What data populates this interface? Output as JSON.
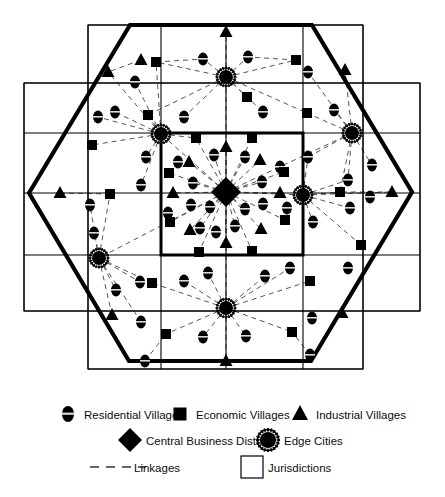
{
  "figure": {
    "colors": {
      "ink": "#000000",
      "background": "#ffffff",
      "linkage": "#555555",
      "jurisdiction_line": "#000000",
      "hexagon": "#000000"
    },
    "hexagon": {
      "name": "metropolitan-boundary",
      "vertices": [
        [
          29,
          193
        ],
        [
          130,
          25
        ],
        [
          312,
          25
        ],
        [
          412,
          192
        ],
        [
          311,
          361
        ],
        [
          129,
          361
        ]
      ]
    },
    "jurisdiction_grid": {
      "vertical_lines": [
        24,
        88,
        161,
        226,
        303,
        363,
        420
      ],
      "horizontal_lines": [
        25,
        83,
        133,
        193,
        255,
        311,
        369
      ],
      "outer_rect": {
        "x": 24,
        "y": 83,
        "w": 396,
        "h": 228
      },
      "inner_rect": {
        "x": 88,
        "y": 25,
        "w": 275,
        "h": 344
      },
      "central_jurisdiction": {
        "x": 161,
        "y": 133,
        "w": 142,
        "h": 122
      }
    },
    "central_business_district": {
      "x": 226,
      "y": 192,
      "r": 15
    },
    "edge_cities": [
      {
        "x": 226,
        "y": 77
      },
      {
        "x": 161,
        "y": 134
      },
      {
        "x": 352,
        "y": 133
      },
      {
        "x": 303,
        "y": 195
      },
      {
        "x": 99,
        "y": 258
      },
      {
        "x": 226,
        "y": 308
      }
    ],
    "residential_villages": [
      {
        "x": 203,
        "y": 59
      },
      {
        "x": 248,
        "y": 57
      },
      {
        "x": 135,
        "y": 82
      },
      {
        "x": 308,
        "y": 72
      },
      {
        "x": 115,
        "y": 112
      },
      {
        "x": 184,
        "y": 117
      },
      {
        "x": 263,
        "y": 112
      },
      {
        "x": 334,
        "y": 110
      },
      {
        "x": 98,
        "y": 117
      },
      {
        "x": 146,
        "y": 157
      },
      {
        "x": 141,
        "y": 185
      },
      {
        "x": 90,
        "y": 205
      },
      {
        "x": 178,
        "y": 162
      },
      {
        "x": 214,
        "y": 155
      },
      {
        "x": 245,
        "y": 157
      },
      {
        "x": 193,
        "y": 183
      },
      {
        "x": 262,
        "y": 182
      },
      {
        "x": 210,
        "y": 207
      },
      {
        "x": 245,
        "y": 209
      },
      {
        "x": 263,
        "y": 204
      },
      {
        "x": 191,
        "y": 205
      },
      {
        "x": 168,
        "y": 213
      },
      {
        "x": 200,
        "y": 228
      },
      {
        "x": 235,
        "y": 226
      },
      {
        "x": 216,
        "y": 232
      },
      {
        "x": 280,
        "y": 167
      },
      {
        "x": 287,
        "y": 208
      },
      {
        "x": 308,
        "y": 157
      },
      {
        "x": 313,
        "y": 222
      },
      {
        "x": 348,
        "y": 180
      },
      {
        "x": 350,
        "y": 208
      },
      {
        "x": 372,
        "y": 165
      },
      {
        "x": 370,
        "y": 197
      },
      {
        "x": 140,
        "y": 282
      },
      {
        "x": 116,
        "y": 290
      },
      {
        "x": 184,
        "y": 281
      },
      {
        "x": 208,
        "y": 273
      },
      {
        "x": 265,
        "y": 276
      },
      {
        "x": 290,
        "y": 268
      },
      {
        "x": 348,
        "y": 268
      },
      {
        "x": 203,
        "y": 337
      },
      {
        "x": 246,
        "y": 336
      },
      {
        "x": 145,
        "y": 361
      },
      {
        "x": 310,
        "y": 355
      },
      {
        "x": 94,
        "y": 233
      },
      {
        "x": 141,
        "y": 322
      },
      {
        "x": 312,
        "y": 318
      }
    ],
    "economic_villages": [
      {
        "x": 156,
        "y": 62
      },
      {
        "x": 296,
        "y": 60
      },
      {
        "x": 148,
        "y": 115
      },
      {
        "x": 307,
        "y": 113
      },
      {
        "x": 92,
        "y": 145
      },
      {
        "x": 196,
        "y": 138
      },
      {
        "x": 252,
        "y": 138
      },
      {
        "x": 169,
        "y": 173
      },
      {
        "x": 284,
        "y": 172
      },
      {
        "x": 170,
        "y": 222
      },
      {
        "x": 285,
        "y": 220
      },
      {
        "x": 199,
        "y": 252
      },
      {
        "x": 252,
        "y": 251
      },
      {
        "x": 110,
        "y": 194
      },
      {
        "x": 340,
        "y": 192
      },
      {
        "x": 152,
        "y": 283
      },
      {
        "x": 310,
        "y": 281
      },
      {
        "x": 166,
        "y": 334
      },
      {
        "x": 292,
        "y": 332
      },
      {
        "x": 361,
        "y": 245
      },
      {
        "x": 247,
        "y": 97
      }
    ],
    "industrial_villages": [
      {
        "x": 226,
        "y": 32
      },
      {
        "x": 108,
        "y": 72
      },
      {
        "x": 345,
        "y": 70
      },
      {
        "x": 226,
        "y": 147
      },
      {
        "x": 189,
        "y": 162
      },
      {
        "x": 260,
        "y": 160
      },
      {
        "x": 173,
        "y": 193
      },
      {
        "x": 280,
        "y": 193
      },
      {
        "x": 190,
        "y": 230
      },
      {
        "x": 261,
        "y": 229
      },
      {
        "x": 226,
        "y": 243
      },
      {
        "x": 60,
        "y": 193
      },
      {
        "x": 392,
        "y": 192
      },
      {
        "x": 112,
        "y": 315
      },
      {
        "x": 342,
        "y": 313
      },
      {
        "x": 226,
        "y": 361
      },
      {
        "x": 141,
        "y": 60
      }
    ],
    "linkages": [
      [
        226,
        192,
        226,
        77
      ],
      [
        226,
        192,
        161,
        134
      ],
      [
        226,
        192,
        352,
        133
      ],
      [
        226,
        192,
        303,
        195
      ],
      [
        226,
        192,
        99,
        258
      ],
      [
        226,
        192,
        226,
        308
      ],
      [
        226,
        192,
        196,
        138
      ],
      [
        226,
        192,
        252,
        138
      ],
      [
        226,
        192,
        169,
        173
      ],
      [
        226,
        192,
        284,
        172
      ],
      [
        226,
        192,
        170,
        222
      ],
      [
        226,
        192,
        285,
        220
      ],
      [
        226,
        192,
        199,
        252
      ],
      [
        226,
        192,
        252,
        251
      ],
      [
        226,
        192,
        214,
        155
      ],
      [
        226,
        192,
        245,
        157
      ],
      [
        226,
        192,
        193,
        183
      ],
      [
        226,
        192,
        262,
        182
      ],
      [
        226,
        192,
        210,
        207
      ],
      [
        226,
        192,
        245,
        209
      ],
      [
        226,
        192,
        200,
        228
      ],
      [
        226,
        192,
        235,
        226
      ],
      [
        226,
        192,
        189,
        162
      ],
      [
        226,
        192,
        260,
        160
      ],
      [
        226,
        192,
        173,
        193
      ],
      [
        226,
        192,
        280,
        193
      ],
      [
        226,
        192,
        190,
        230
      ],
      [
        226,
        192,
        261,
        229
      ],
      [
        226,
        192,
        226,
        147
      ],
      [
        226,
        192,
        226,
        243
      ],
      [
        226,
        77,
        203,
        59
      ],
      [
        226,
        77,
        248,
        57
      ],
      [
        226,
        77,
        156,
        62
      ],
      [
        226,
        77,
        296,
        60
      ],
      [
        226,
        77,
        226,
        32
      ],
      [
        226,
        77,
        148,
        115
      ],
      [
        226,
        77,
        307,
        113
      ],
      [
        226,
        77,
        184,
        117
      ],
      [
        226,
        77,
        263,
        112
      ],
      [
        226,
        77,
        247,
        97
      ],
      [
        161,
        134,
        135,
        82
      ],
      [
        161,
        134,
        115,
        112
      ],
      [
        161,
        134,
        98,
        117
      ],
      [
        161,
        134,
        92,
        145
      ],
      [
        161,
        134,
        146,
        157
      ],
      [
        161,
        134,
        141,
        185
      ],
      [
        161,
        134,
        108,
        72
      ],
      [
        161,
        134,
        156,
        62
      ],
      [
        161,
        134,
        148,
        115
      ],
      [
        161,
        134,
        196,
        138
      ],
      [
        352,
        133,
        308,
        72
      ],
      [
        352,
        133,
        334,
        110
      ],
      [
        352,
        133,
        307,
        113
      ],
      [
        352,
        133,
        345,
        70
      ],
      [
        352,
        133,
        340,
        192
      ],
      [
        352,
        133,
        372,
        165
      ],
      [
        352,
        133,
        348,
        180
      ],
      [
        352,
        133,
        308,
        157
      ],
      [
        303,
        195,
        340,
        192
      ],
      [
        303,
        195,
        348,
        180
      ],
      [
        303,
        195,
        350,
        208
      ],
      [
        303,
        195,
        313,
        222
      ],
      [
        303,
        195,
        308,
        157
      ],
      [
        303,
        195,
        361,
        245
      ],
      [
        303,
        195,
        392,
        192
      ],
      [
        99,
        258,
        90,
        205
      ],
      [
        99,
        258,
        140,
        282
      ],
      [
        99,
        258,
        116,
        290
      ],
      [
        99,
        258,
        94,
        233
      ],
      [
        99,
        258,
        152,
        283
      ],
      [
        99,
        258,
        141,
        322
      ],
      [
        99,
        258,
        110,
        194
      ],
      [
        99,
        258,
        112,
        315
      ],
      [
        226,
        308,
        184,
        281
      ],
      [
        226,
        308,
        208,
        273
      ],
      [
        226,
        308,
        265,
        276
      ],
      [
        226,
        308,
        290,
        268
      ],
      [
        226,
        308,
        203,
        337
      ],
      [
        226,
        308,
        246,
        336
      ],
      [
        226,
        308,
        166,
        334
      ],
      [
        226,
        308,
        292,
        332
      ],
      [
        226,
        308,
        226,
        361
      ],
      [
        226,
        308,
        152,
        283
      ],
      [
        226,
        308,
        310,
        281
      ],
      [
        156,
        62,
        203,
        59
      ],
      [
        296,
        60,
        248,
        57
      ],
      [
        60,
        193,
        110,
        194
      ],
      [
        392,
        192,
        340,
        192
      ],
      [
        141,
        60,
        108,
        72
      ],
      [
        145,
        361,
        166,
        334
      ],
      [
        310,
        355,
        292,
        332
      ]
    ]
  },
  "legend": {
    "name": "figure-legend",
    "rows": [
      {
        "items": [
          {
            "symbol": "residential-village-icon",
            "label": "Residential Villages"
          },
          {
            "symbol": "economic-village-icon",
            "label": "Economic Villages"
          },
          {
            "symbol": "industrial-village-icon",
            "label": "Industrial Villages"
          }
        ]
      },
      {
        "items": [
          {
            "symbol": "central-business-district-icon",
            "label": "Central Business District"
          },
          {
            "symbol": "edge-city-icon",
            "label": "Edge Cities"
          }
        ]
      },
      {
        "items": [
          {
            "symbol": "linkage-dashed-line-icon",
            "label": "Linkages"
          },
          {
            "symbol": "jurisdiction-square-icon",
            "label": "Jurisdictions"
          }
        ]
      }
    ]
  }
}
